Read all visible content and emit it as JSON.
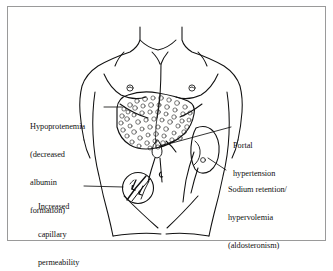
{
  "figure": {
    "style": "black-and-white pen line drawing",
    "border_color": "#9a9a9a",
    "ink_color": "#111111",
    "background": "#ffffff"
  },
  "labels": {
    "hypoproteinemia": {
      "line1": "Hypoprotenemia",
      "line2": "(decreased",
      "line3": "albumin",
      "line4": "formation)",
      "points_to": "liver"
    },
    "portal_hypertension": {
      "line1": "Portal",
      "line2": "hypertension",
      "points_to": "portal-vein"
    },
    "sodium_retention": {
      "line1": "Sodium retention/",
      "line2": "hypervolemia",
      "line3": "(aldosteronism)",
      "points_to": "kidney"
    },
    "capillary_permeability": {
      "line1": "Increased",
      "line2": "capillary",
      "line3": "permeability",
      "points_to": "capillary-inset"
    }
  },
  "anatomy": {
    "torso": "male-torso-outline",
    "liver": "cirrhotic-nodular-liver",
    "kidney": "right-kidney",
    "gallbladder": "gallbladder",
    "navel": "umbilicus",
    "inset": "capillary-leak-circle-inset"
  }
}
